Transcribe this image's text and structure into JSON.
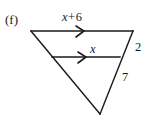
{
  "figure": {
    "part_label": "(f)",
    "shape": "triangle",
    "labels": {
      "top_side": {
        "expression": "x + 6",
        "variable": "x",
        "operator": "+",
        "constant": "6"
      },
      "mid_segment": "x",
      "upper_right_side": "2",
      "lower_right_side": "7"
    },
    "markers": {
      "parallel_tick": "single-chevron-arrowhead",
      "count": 2
    },
    "geometry": {
      "top_left_vertex": [
        31,
        31
      ],
      "top_right_vertex": [
        133,
        31
      ],
      "bottom_apex": [
        100,
        114
      ],
      "mid_segment_left": [
        52,
        57
      ],
      "mid_segment_right": [
        120,
        57
      ]
    },
    "colors": {
      "stroke": "#1a1a1a",
      "background": "#ffffff",
      "text": "#1a1a1a"
    }
  }
}
